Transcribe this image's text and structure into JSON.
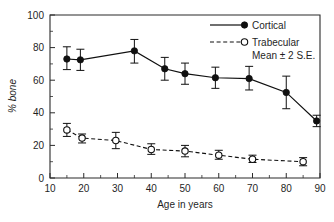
{
  "chart_data": {
    "type": "line",
    "title": "",
    "subtitle": "",
    "xlabel": "Age in years",
    "ylabel": "% bone",
    "xlim": [
      10,
      90
    ],
    "ylim": [
      0,
      100
    ],
    "xticks": [
      10,
      20,
      30,
      40,
      50,
      60,
      70,
      80,
      90
    ],
    "xtick_labels": [
      "10",
      "20",
      "30",
      "40",
      "50",
      "60",
      "70",
      "80",
      "90"
    ],
    "xticks_minor": [
      15,
      25,
      35,
      45,
      55,
      65,
      75,
      85
    ],
    "yticks": [
      0,
      20,
      40,
      60,
      80,
      100
    ],
    "ytick_labels": [
      "0",
      "20",
      "40",
      "60",
      "80",
      "100"
    ],
    "yticks_minor": [
      10,
      30,
      50,
      70,
      90
    ],
    "grid": false,
    "legend_position": "top-right",
    "error_bar_note": "Mean ± 2 S.E.",
    "series": [
      {
        "name": "Cortical",
        "marker": "filled-circle",
        "linestyle": "solid",
        "color": "#101010",
        "x": [
          15,
          19,
          35,
          44,
          50,
          59,
          69,
          80,
          89
        ],
        "values": [
          73.0,
          72.5,
          78.0,
          67.0,
          64.0,
          61.5,
          61.0,
          52.5,
          35.0
        ],
        "err_low": [
          66.5,
          66.0,
          70.5,
          60.0,
          57.5,
          55.0,
          54.0,
          42.5,
          31.5
        ],
        "err_high": [
          80.5,
          79.0,
          85.0,
          74.0,
          70.5,
          68.0,
          68.5,
          62.5,
          38.5
        ]
      },
      {
        "name": "Trabecular",
        "marker": "open-circle",
        "linestyle": "dashed",
        "color": "#101010",
        "x": [
          15,
          19.5,
          29.5,
          40,
          50,
          60,
          70,
          85
        ],
        "values": [
          29.5,
          24.5,
          23.0,
          17.5,
          16.5,
          14.0,
          11.5,
          10.0
        ],
        "err_low": [
          25.5,
          21.5,
          18.0,
          14.5,
          13.0,
          11.5,
          9.5,
          7.5
        ],
        "err_high": [
          33.5,
          27.0,
          28.0,
          21.0,
          20.0,
          17.0,
          14.0,
          12.5
        ]
      }
    ]
  },
  "legend": {
    "entries": [
      {
        "label": "Cortical",
        "marker": "filled-circle",
        "linestyle": "solid"
      },
      {
        "label": "Trabecular",
        "marker": "open-circle",
        "linestyle": "dashed"
      }
    ],
    "note": "Mean ± 2 S.E."
  },
  "axes": {
    "x_title": "Age in years",
    "y_title": "% bone"
  }
}
